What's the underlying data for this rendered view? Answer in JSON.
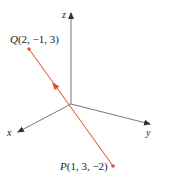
{
  "diagram": {
    "type": "3d-coordinate-axes-with-vector",
    "axes": {
      "x": {
        "label": "x"
      },
      "y": {
        "label": "y"
      },
      "z": {
        "label": "z"
      }
    },
    "points": {
      "Q": {
        "name": "Q",
        "coords": "(2, −1, 3)",
        "label": "Q(2, −1, 3)"
      },
      "P": {
        "name": "P",
        "coords": "(1, 3, −2)",
        "label": "P(1, 3, −2)"
      }
    },
    "vector": {
      "from": "P",
      "to": "Q",
      "direction": "P to Q"
    },
    "colors": {
      "axis": "#555555",
      "vector": "#e06a50",
      "point": "#e0504a",
      "text": "#222222"
    }
  }
}
